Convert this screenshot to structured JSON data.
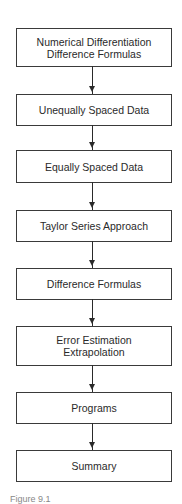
{
  "diagram": {
    "type": "flowchart",
    "direction": "top-to-bottom",
    "nodes": [
      {
        "id": "n1",
        "lines": [
          "Numerical Differentiation",
          "Difference Formulas"
        ]
      },
      {
        "id": "n2",
        "lines": [
          "Unequally Spaced Data"
        ]
      },
      {
        "id": "n3",
        "lines": [
          "Equally Spaced Data"
        ]
      },
      {
        "id": "n4",
        "lines": [
          "Taylor Series Approach"
        ]
      },
      {
        "id": "n5",
        "lines": [
          "Difference Formulas"
        ]
      },
      {
        "id": "n6",
        "lines": [
          "Error Estimation",
          "Extrapolation"
        ]
      },
      {
        "id": "n7",
        "lines": [
          "Programs"
        ]
      },
      {
        "id": "n8",
        "lines": [
          "Summary"
        ]
      }
    ],
    "edges": [
      [
        "n1",
        "n2"
      ],
      [
        "n2",
        "n3"
      ],
      [
        "n3",
        "n4"
      ],
      [
        "n4",
        "n5"
      ],
      [
        "n5",
        "n6"
      ],
      [
        "n6",
        "n7"
      ],
      [
        "n7",
        "n8"
      ]
    ],
    "caption": "Figure 9.1"
  }
}
